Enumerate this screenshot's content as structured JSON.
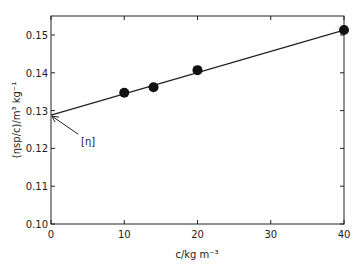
{
  "chart_data": {
    "type": "scatter",
    "title": "",
    "xlabel": "c/kg m⁻³",
    "ylabel": "(ηsp/c)/m³ kg⁻¹",
    "xlim": [
      0,
      40
    ],
    "ylim": [
      0.1,
      0.155
    ],
    "x_ticks": [
      0,
      10,
      20,
      30,
      40
    ],
    "x_tick_labels": [
      "0",
      "10",
      "20",
      "30",
      "40"
    ],
    "y_ticks": [
      0.1,
      0.11,
      0.12,
      0.13,
      0.14,
      0.15
    ],
    "y_tick_labels": [
      "0.10",
      "0.11",
      "0.12",
      "0.13",
      "0.14",
      "0.15"
    ],
    "grid": false,
    "legend": null,
    "series": [
      {
        "name": "measured",
        "marker": "filled-circle",
        "x": [
          10,
          14,
          20,
          40
        ],
        "y": [
          0.1347,
          0.1362,
          0.1407,
          0.1513
        ]
      },
      {
        "name": "linear fit",
        "style": "line",
        "x": [
          0,
          40
        ],
        "y": [
          0.1288,
          0.1513
        ]
      }
    ],
    "annotations": [
      {
        "text": "[η]",
        "points_to": {
          "x": 0,
          "y": 0.1288
        },
        "type": "arrow"
      }
    ]
  },
  "colors": {
    "ink": "#222222",
    "background": "#ffffff"
  }
}
